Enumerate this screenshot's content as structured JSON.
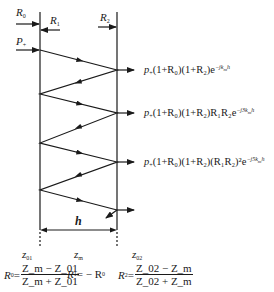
{
  "diagram": {
    "incident_labels": {
      "r0": {
        "base": "R",
        "sub": "0"
      },
      "r1": {
        "base": "R",
        "sub": "1"
      },
      "r2": {
        "base": "R",
        "sub": "2"
      },
      "p_plus": {
        "base": "P",
        "sub": "+"
      }
    },
    "outputs": [
      {
        "prefix": "p",
        "sub": "+",
        "body": "(1+R₀)(1+R₂)",
        "exp": "−jk",
        "exp_tail": "h"
      },
      {
        "prefix": "p",
        "sub": "+",
        "body": "(1+R₀)(1+R₂)R₁R₂",
        "exp": "−j3k",
        "exp_tail": "h"
      },
      {
        "prefix": "p",
        "sub": "+",
        "body": "(1+R₀)(1+R₂)(R₁R₂)²",
        "exp": "−j5k",
        "exp_tail": "h"
      }
    ],
    "thickness_label": "h",
    "impedance_labels": {
      "z01": {
        "base": "z",
        "sub": "01"
      },
      "zm": {
        "base": "z",
        "sub": "m"
      },
      "z02": {
        "base": "z",
        "sub": "02"
      }
    },
    "formulas": {
      "r0": {
        "lhs": "R",
        "lhs_sub": "0",
        "num": "Z_m − Z_01",
        "den": "Z_m + Z_01"
      },
      "r1": {
        "lhs": "R",
        "lhs_sub": "1",
        "rhs": "= − R",
        "rhs_sub": "0"
      },
      "r2": {
        "lhs": "R",
        "lhs_sub": "2",
        "num": "Z_02 − Z_m",
        "den": "Z_02 + Z_m"
      }
    },
    "colors": {
      "line": "#1a1a1a",
      "background": "#ffffff"
    }
  }
}
